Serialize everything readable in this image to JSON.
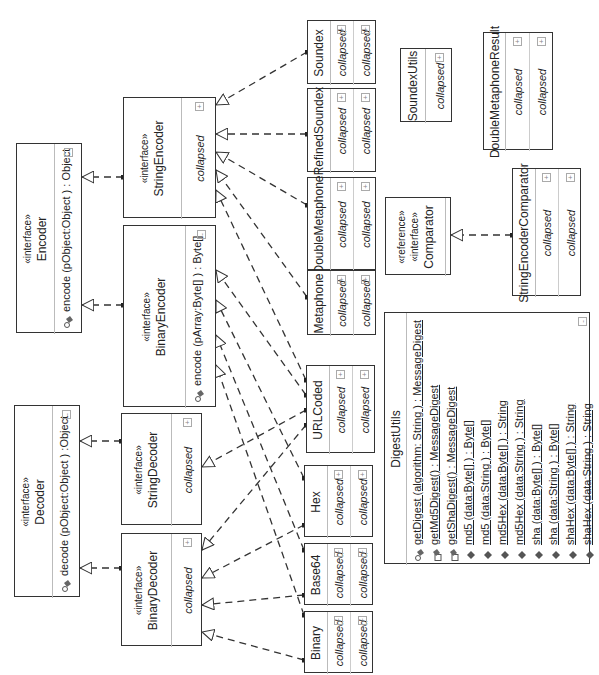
{
  "diagram": {
    "type": "UML class diagram (rotated 90° counter-clockwise)",
    "collapsed_label": "collapsed",
    "expand_toggle": "+",
    "collapse_toggle": "-"
  },
  "classes": {
    "encoder": {
      "stereotype": "«interface»",
      "name": "Encoder",
      "operation": "encode (pObject:Object ) : Object"
    },
    "decoder": {
      "stereotype": "«interface»",
      "name": "Decoder",
      "operation": "decode (pObject:Object ) :Object"
    },
    "string_encoder": {
      "stereotype": "«interface»",
      "name": "StringEncoder",
      "compartment": "collapsed"
    },
    "binary_encoder": {
      "stereotype": "«interface»",
      "name": "BinaryEncoder",
      "operation": "encode (pArray:Byte[] ) : Byte[]"
    },
    "string_decoder": {
      "stereotype": "«interface»",
      "name": "StringDecoder",
      "compartment": "collapsed"
    },
    "binary_decoder": {
      "stereotype": "«interface»",
      "name": "BinaryDecoder",
      "compartment": "collapsed"
    },
    "soundex": {
      "name": "Soundex",
      "compartments": [
        "collapsed",
        "collapsed"
      ]
    },
    "refined_soundex": {
      "name": "RefinedSoundex",
      "compartments": [
        "collapsed",
        "collapsed"
      ]
    },
    "double_metaphone": {
      "name": "DoubleMetaphone",
      "compartments": [
        "collapsed",
        "collapsed"
      ]
    },
    "metaphone": {
      "name": "Metaphone",
      "compartments": [
        "collapsed",
        "collapsed"
      ]
    },
    "url_coded": {
      "name": "URLCoded",
      "compartments": [
        "collapsed",
        "collapsed"
      ]
    },
    "hex": {
      "name": "Hex",
      "compartments": [
        "collapsed",
        "collapsed"
      ]
    },
    "base64": {
      "name": "Base64",
      "compartments": [
        "collapsed",
        "collapsed"
      ]
    },
    "binary": {
      "name": "Binary",
      "compartments": [
        "collapsed",
        "collapsed"
      ]
    },
    "soundex_utils": {
      "name": "SoundexUtils",
      "compartments": [
        "collapsed"
      ]
    },
    "double_metaphone_result": {
      "name": "DoubleMetaphoneResult",
      "compartments": [
        "collapsed",
        "collapsed"
      ]
    },
    "comparator": {
      "stereotypes": [
        "«reference»",
        "«interface»"
      ],
      "name": "Comparator"
    },
    "string_encoder_comparator": {
      "name": "StringEncoderComparator",
      "compartments": [
        "collapsed",
        "collapsed"
      ]
    },
    "digest_utils": {
      "name": "DigestUtils",
      "operations": [
        {
          "icon": "private-static-method-icon",
          "text": "getDigest (algorithm: String ) : MessageDigest"
        },
        {
          "icon": "static-method-icon",
          "text": "getMd5Digest() : MessageDigest"
        },
        {
          "icon": "static-method-icon",
          "text": "getShaDigest() : MessageDigest"
        },
        {
          "icon": "public-method-icon",
          "text": "md5 (data:Byte[] ) : Byte[]"
        },
        {
          "icon": "public-method-icon",
          "text": "md5 (data:String ) : Byte[]"
        },
        {
          "icon": "public-method-icon",
          "text": "md5Hex (data:Byte[] ) : String"
        },
        {
          "icon": "public-method-icon",
          "text": "md5Hex (data:String ) : String"
        },
        {
          "icon": "public-method-icon",
          "text": "sha (data:Byte[] ) : Byte[]"
        },
        {
          "icon": "public-method-icon",
          "text": "sha (data:String ) : Byte[]"
        },
        {
          "icon": "public-method-icon",
          "text": "shaHex (data:Byte[] ) : String"
        },
        {
          "icon": "public-method-icon",
          "text": "shaHex (data:String ) : String"
        }
      ]
    }
  },
  "relationships": [
    {
      "type": "realization",
      "from": "StringEncoder",
      "to": "Encoder"
    },
    {
      "type": "realization",
      "from": "BinaryEncoder",
      "to": "Encoder"
    },
    {
      "type": "realization",
      "from": "StringDecoder",
      "to": "Decoder"
    },
    {
      "type": "realization",
      "from": "BinaryDecoder",
      "to": "Decoder"
    },
    {
      "type": "realization",
      "from": "Soundex",
      "to": "StringEncoder"
    },
    {
      "type": "realization",
      "from": "RefinedSoundex",
      "to": "StringEncoder"
    },
    {
      "type": "realization",
      "from": "DoubleMetaphone",
      "to": "StringEncoder"
    },
    {
      "type": "realization",
      "from": "Metaphone",
      "to": "StringEncoder"
    },
    {
      "type": "realization",
      "from": "URLCoded",
      "to": "StringEncoder"
    },
    {
      "type": "realization",
      "from": "URLCoded",
      "to": "BinaryEncoder"
    },
    {
      "type": "realization",
      "from": "Hex",
      "to": "BinaryEncoder"
    },
    {
      "type": "realization",
      "from": "Base64",
      "to": "BinaryEncoder"
    },
    {
      "type": "realization",
      "from": "Binary",
      "to": "BinaryEncoder"
    },
    {
      "type": "realization",
      "from": "URLCoded",
      "to": "StringDecoder"
    },
    {
      "type": "realization",
      "from": "URLCoded",
      "to": "BinaryDecoder"
    },
    {
      "type": "realization",
      "from": "Hex",
      "to": "BinaryDecoder"
    },
    {
      "type": "realization",
      "from": "Base64",
      "to": "BinaryDecoder"
    },
    {
      "type": "realization",
      "from": "Binary",
      "to": "BinaryDecoder"
    },
    {
      "type": "realization",
      "from": "StringEncoderComparator",
      "to": "Comparator"
    }
  ],
  "colors": {
    "line": "#333333",
    "divider": "#bbbbbb",
    "background": "#ffffff"
  }
}
